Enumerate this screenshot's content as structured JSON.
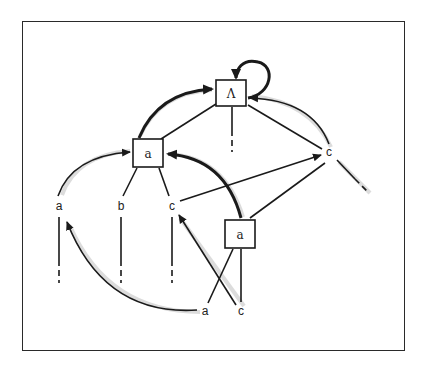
{
  "diagram": {
    "colors": {
      "stroke": "#1a1a1a",
      "shadow": "#d8d8d8",
      "frame": "#2a2a2a"
    },
    "boxes": [
      {
        "id": "lambda",
        "label": "Λ"
      },
      {
        "id": "a-top",
        "label": "a"
      },
      {
        "id": "a-low",
        "label": "a"
      }
    ],
    "nodes": [
      {
        "id": "c-right",
        "label": "c"
      },
      {
        "id": "a-left",
        "label": "a"
      },
      {
        "id": "b-mid",
        "label": "b"
      },
      {
        "id": "c-mid",
        "label": "c"
      },
      {
        "id": "a-bottom",
        "label": "a"
      },
      {
        "id": "c-bottom",
        "label": "c"
      }
    ],
    "edges": [
      {
        "from": "lambda",
        "to": "lambda",
        "kind": "self-loop",
        "bold": true,
        "arrow": true
      },
      {
        "from": "a-top",
        "to": "lambda",
        "kind": "curve",
        "bold": true,
        "arrow": true
      },
      {
        "from": "a-top",
        "to": "lambda",
        "kind": "line",
        "bold": false,
        "arrow": false
      },
      {
        "from": "lambda",
        "to": "c-right",
        "kind": "line",
        "bold": false,
        "arrow": false
      },
      {
        "from": "c-right",
        "to": "lambda",
        "kind": "curve",
        "bold": false,
        "arrow": true
      },
      {
        "from": "lambda",
        "to": "lambda-down",
        "kind": "dashed-tail",
        "bold": false,
        "arrow": false
      },
      {
        "from": "c-right",
        "to": "c-right-down",
        "kind": "dashed-tail",
        "bold": false,
        "arrow": false
      },
      {
        "from": "a-left",
        "to": "a-top",
        "kind": "curve",
        "bold": false,
        "arrow": true
      },
      {
        "from": "a-top",
        "to": "b-mid",
        "kind": "line",
        "bold": false,
        "arrow": false
      },
      {
        "from": "a-top",
        "to": "c-mid",
        "kind": "line",
        "bold": false,
        "arrow": false
      },
      {
        "from": "a-low",
        "to": "a-top",
        "kind": "curve",
        "bold": true,
        "arrow": true
      },
      {
        "from": "c-mid",
        "to": "c-right",
        "kind": "line",
        "bold": false,
        "arrow": true
      },
      {
        "from": "a-low",
        "to": "c-right",
        "kind": "line",
        "bold": false,
        "arrow": false
      },
      {
        "from": "a-low",
        "to": "a-bottom",
        "kind": "line",
        "bold": false,
        "arrow": false
      },
      {
        "from": "a-low",
        "to": "c-bottom",
        "kind": "line",
        "bold": false,
        "arrow": false
      },
      {
        "from": "c-bottom",
        "to": "c-mid",
        "kind": "line",
        "bold": false,
        "arrow": true
      },
      {
        "from": "a-bottom",
        "to": "a-left",
        "kind": "curve",
        "bold": false,
        "arrow": true
      },
      {
        "from": "a-left",
        "to": "a-left-down",
        "kind": "dashed-tail",
        "bold": false,
        "arrow": false
      },
      {
        "from": "b-mid",
        "to": "b-mid-down",
        "kind": "dashed-tail",
        "bold": false,
        "arrow": false
      },
      {
        "from": "c-mid",
        "to": "c-mid-down",
        "kind": "dashed-tail",
        "bold": false,
        "arrow": false
      }
    ]
  }
}
